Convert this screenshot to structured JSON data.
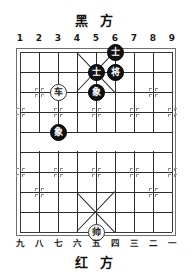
{
  "board": {
    "top_label": "黑  方",
    "bottom_label": "红  方",
    "files_top": [
      "1",
      "2",
      "3",
      "4",
      "5",
      "6",
      "7",
      "8",
      "9"
    ],
    "files_bottom": [
      "九",
      "八",
      "七",
      "六",
      "五",
      "四",
      "三",
      "二",
      "一"
    ],
    "colors": {
      "black_piece": "#111111",
      "red_piece_border": "#333333",
      "line": "#2b2b2b",
      "border": "#6f6f6f",
      "star": "#8c8c8c"
    },
    "pieces": [
      {
        "name": "black-advisor-1",
        "glyph": "士",
        "side": "black",
        "file": 6,
        "rank": 0
      },
      {
        "name": "black-advisor-2",
        "glyph": "士",
        "side": "black",
        "file": 5,
        "rank": 1
      },
      {
        "name": "black-general",
        "glyph": "将",
        "side": "black",
        "file": 6,
        "rank": 1
      },
      {
        "name": "black-elephant-1",
        "glyph": "象",
        "side": "black",
        "file": 5,
        "rank": 2
      },
      {
        "name": "red-chariot",
        "glyph": "车",
        "side": "red",
        "file": 3,
        "rank": 2
      },
      {
        "name": "black-elephant-2",
        "glyph": "象",
        "side": "black",
        "file": 3,
        "rank": 4
      },
      {
        "name": "red-marshal",
        "glyph": "帅",
        "side": "red",
        "file": 5,
        "rank": 9
      }
    ],
    "star_points": [
      {
        "file": 2,
        "rank": 2
      },
      {
        "file": 8,
        "rank": 2
      },
      {
        "file": 1,
        "rank": 3
      },
      {
        "file": 3,
        "rank": 3
      },
      {
        "file": 5,
        "rank": 3
      },
      {
        "file": 7,
        "rank": 3
      },
      {
        "file": 9,
        "rank": 3
      },
      {
        "file": 2,
        "rank": 7
      },
      {
        "file": 8,
        "rank": 7
      },
      {
        "file": 1,
        "rank": 6
      },
      {
        "file": 3,
        "rank": 6
      },
      {
        "file": 5,
        "rank": 6
      },
      {
        "file": 7,
        "rank": 6
      },
      {
        "file": 9,
        "rank": 6
      }
    ]
  }
}
